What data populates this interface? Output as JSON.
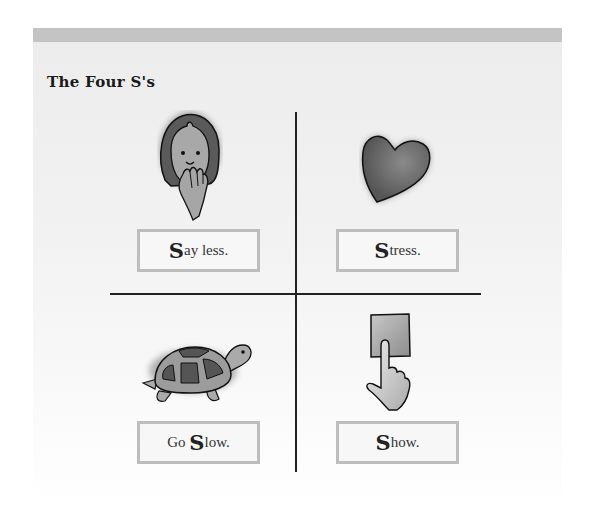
{
  "title": "The Four S's",
  "quadrants": [
    {
      "id": "say-less",
      "icon": "face-hand-over-mouth",
      "prefix": "",
      "letter": "S",
      "rest": "ay less."
    },
    {
      "id": "stress",
      "icon": "heart",
      "prefix": "",
      "letter": "S",
      "rest": "tress."
    },
    {
      "id": "go-slow",
      "icon": "turtle",
      "prefix": "Go ",
      "letter": "S",
      "rest": "low."
    },
    {
      "id": "show",
      "icon": "hand-pointing-at-card",
      "prefix": "",
      "letter": "S",
      "rest": "how."
    }
  ],
  "colors": {
    "topbar": "#c4c4c4",
    "box_border": "#bdbdbd",
    "divider": "#222222"
  }
}
